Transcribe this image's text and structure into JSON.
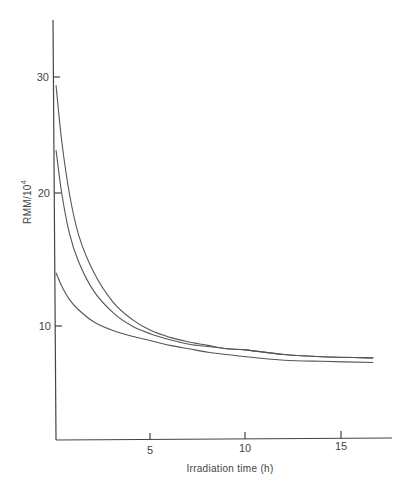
{
  "chart_data": {
    "type": "line",
    "title": "",
    "xlabel": "Irradiation time (h)",
    "ylabel": "RMM/10",
    "ylabel_superscript": "4",
    "xlim": [
      0,
      17.7
    ],
    "ylim": [
      0,
      35
    ],
    "x_ticks": [
      5,
      10,
      15
    ],
    "y_ticks": [
      10,
      20,
      30
    ],
    "grid": false,
    "legend": null,
    "series": [
      {
        "name": "curve 1 (upper)",
        "x": [
          0,
          0.3,
          0.7,
          1.2,
          2.0,
          3.0,
          4.0,
          5.0,
          6.0,
          7.0,
          8.0,
          9.0,
          10.0,
          12.0,
          14.0,
          16.7
        ],
        "y": [
          29.3,
          24.5,
          20.0,
          16.8,
          14.0,
          11.8,
          10.5,
          9.6,
          9.0,
          8.6,
          8.3,
          8.0,
          7.9,
          7.5,
          7.3,
          7.2
        ]
      },
      {
        "name": "curve 2 (middle)",
        "x": [
          0,
          0.3,
          0.7,
          1.2,
          2.0,
          3.0,
          4.0,
          5.0,
          6.0,
          7.0,
          8.0,
          9.0,
          10.0,
          12.0,
          14.0,
          16.7
        ],
        "y": [
          23.7,
          20.0,
          17.0,
          14.8,
          12.6,
          11.0,
          10.0,
          9.3,
          8.8,
          8.4,
          8.2,
          8.0,
          7.9,
          7.5,
          7.3,
          7.2
        ]
      },
      {
        "name": "curve 3 (lower)",
        "x": [
          0,
          0.3,
          0.7,
          1.2,
          2.0,
          3.0,
          4.0,
          5.0,
          6.0,
          7.0,
          8.0,
          9.0,
          10.0,
          12.0,
          14.0,
          16.7
        ],
        "y": [
          14.0,
          13.0,
          12.0,
          11.2,
          10.3,
          9.6,
          9.1,
          8.7,
          8.3,
          8.0,
          7.7,
          7.5,
          7.3,
          7.0,
          6.9,
          6.8
        ]
      }
    ]
  }
}
